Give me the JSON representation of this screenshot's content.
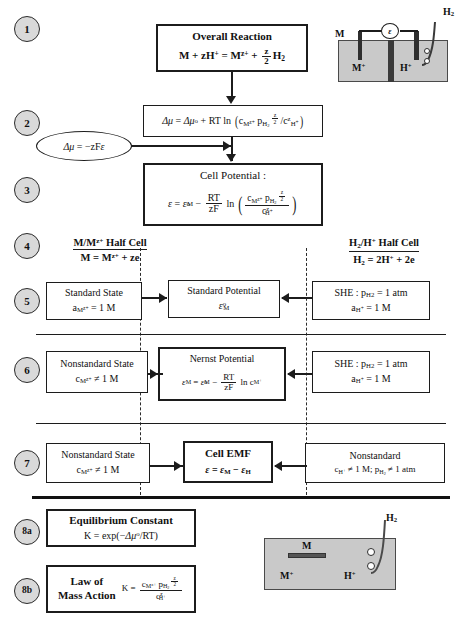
{
  "diagram": {
    "steps": [
      {
        "id": "1",
        "label": "1"
      },
      {
        "id": "2",
        "label": "2"
      },
      {
        "id": "3",
        "label": "3"
      },
      {
        "id": "4",
        "label": "4"
      },
      {
        "id": "5",
        "label": "5"
      },
      {
        "id": "6",
        "label": "6"
      },
      {
        "id": "7",
        "label": "7"
      },
      {
        "id": "8a",
        "label": "8a"
      },
      {
        "id": "8b",
        "label": "8b"
      }
    ]
  },
  "row1": {
    "title": "Overall Reaction",
    "reaction_plain": "M + zH+ = Mz+ + z/2 H2"
  },
  "row2": {
    "equation_plain": "Δμ = Δμo + RT ln( cMz+ pH2^(z/2) / czH+ )",
    "ellipse_plain": "Δμ = −zFε"
  },
  "row3": {
    "title": "Cell Potential :",
    "equation_plain": "ε = εoM − (RT/zF) ln( cMz+ pH2^(z/2) / czH+ )"
  },
  "row4": {
    "left_title_plain": "M/Mz+ Half Cell",
    "left_reaction_plain": "M = Mz+ + ze",
    "right_title_plain": "H2/H+ Half Cell",
    "right_reaction_plain": "H2 = 2H+ + 2e"
  },
  "row5": {
    "left_title": "Standard State",
    "left_value_plain": "aMz+ = 1 M",
    "center_title": "Standard Potential",
    "center_value_plain": "εoM",
    "right_line1_plain": "SHE : pH2 = 1 atm",
    "right_line2_plain": "aH+ = 1 M"
  },
  "row6": {
    "left_title": "Nonstandard State",
    "left_value_plain": "cMz+ ≠ 1 M",
    "center_title": "Nernst Potential",
    "center_value_plain": "εM = εoM − (RT/zF) ln cM+",
    "right_line1_plain": "SHE : pH2 = 1 atm",
    "right_line2_plain": "aH+ = 1 M"
  },
  "row7": {
    "left_title": "Nonstandard State",
    "left_value_plain": "cMz+ ≠ 1 M",
    "center_title": "Cell EMF",
    "center_value_plain": "ε = εM − εH",
    "right_title": "Nonstandard",
    "right_value_plain": "cH+ ≠ 1 M; pH2 ≠ 1 atm"
  },
  "row8a": {
    "title": "Equilibrium Constant",
    "equation_plain": "K = exp(−Δμo/RT)"
  },
  "row8b": {
    "title_line1": "Law of",
    "title_line2": "Mass Action",
    "equation_plain": "K = cMz+ pH2^(z/2) / czH+"
  },
  "cell_top": {
    "label_metal": "M",
    "label_metal_ion": "M+",
    "label_h_ion": "H+",
    "label_h2": "H2",
    "meter_symbol": "ε"
  },
  "cell_bottom": {
    "label_metal": "M",
    "label_metal_ion": "M+",
    "label_h_ion": "H+",
    "label_h2": "H2"
  },
  "colors": {
    "ink": "#1c1c1c",
    "circle_fill": "#d9d9d9",
    "electrolyte": "#c9c9c9",
    "electrode": "#2e2e2e",
    "paper": "#ffffff"
  }
}
